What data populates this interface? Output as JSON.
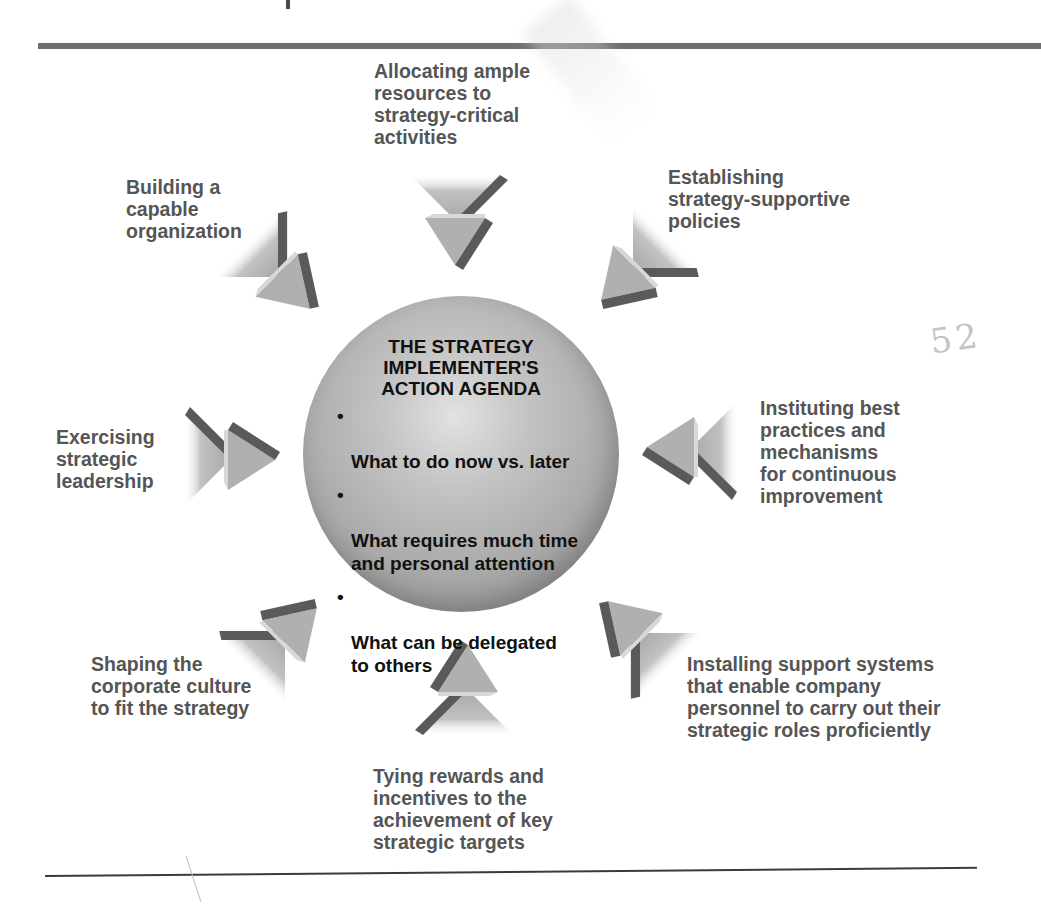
{
  "diagram": {
    "center": {
      "title": "THE STRATEGY\nIMPLEMENTER'S\nACTION AGENDA",
      "bullets": [
        "What to do now vs. later",
        "What requires much time\nand personal attention",
        "What can be delegated\nto others"
      ],
      "bullet_glyph": "•"
    },
    "spokes": [
      {
        "position": "top",
        "label": "Allocating ample\nresources to\nstrategy-critical\nactivities",
        "arrow_direction": "down"
      },
      {
        "position": "top-right",
        "label": "Establishing\nstrategy-supportive\npolicies",
        "arrow_direction": "down-left"
      },
      {
        "position": "right",
        "label": "Instituting best\npractices and\nmechanisms\nfor continuous\nimprovement",
        "arrow_direction": "left"
      },
      {
        "position": "bottom-right",
        "label": "Installing support systems\nthat enable company\npersonnel to carry out their\nstrategic roles proficiently",
        "arrow_direction": "up-left"
      },
      {
        "position": "bottom",
        "label": "Tying rewards and\nincentives to the\nachievement of key\nstrategic targets",
        "arrow_direction": "up"
      },
      {
        "position": "bottom-left",
        "label": "Shaping the\ncorporate culture\nto fit the strategy",
        "arrow_direction": "up-right"
      },
      {
        "position": "left",
        "label": "Exercising\nstrategic\nleadership",
        "arrow_direction": "right"
      },
      {
        "position": "top-left",
        "label": "Building a\ncapable\norganization",
        "arrow_direction": "down-right"
      }
    ],
    "annotation": "52",
    "colors": {
      "label_text": "#555555",
      "center_text": "#111111",
      "arrow_face": "#b5b5b5",
      "arrow_shadow": "#5a5a5a",
      "rule": "#6f6f6f"
    }
  }
}
